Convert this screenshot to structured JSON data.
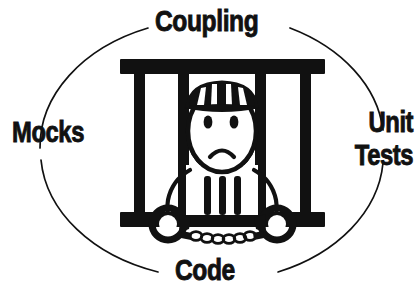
{
  "diagram": {
    "background_color": "#ffffff",
    "ink_color": "#111111",
    "labels": {
      "top": "Coupling",
      "left": "Mocks",
      "right_line1": "Unit",
      "right_line2": "Tests",
      "bottom": "Code"
    },
    "figure": {
      "name": "prisoner-stick-figure",
      "description": "Stick figure with striped prison cap, sad frowning face, striped shirt, wrists in handcuffs joined by a chain, standing behind jail bars",
      "cap_stripes": 4,
      "shirt_stripes": 3,
      "jail_vertical_bars": 4,
      "jail_horizontal_bars": 2,
      "handcuffs": 2,
      "chain_links": 8,
      "expression": "frown"
    },
    "ellipse": {
      "name": "broken-ellipse-arcs",
      "arc_count": 4,
      "stroke_width": 1.6
    }
  }
}
